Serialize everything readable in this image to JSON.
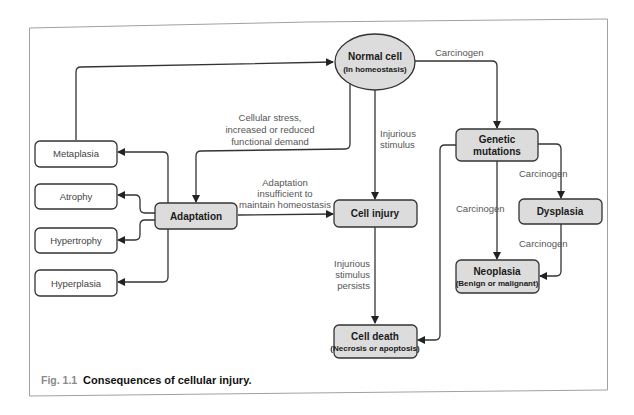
{
  "figure": {
    "number": "Fig. 1.1",
    "caption": "Consequences of cellular injury."
  },
  "nodes": {
    "normal_cell": {
      "title": "Normal cell",
      "subtitle": "(In homeostasis)"
    },
    "adaptation": {
      "title": "Adaptation"
    },
    "metaplasia": {
      "title": "Metaplasia"
    },
    "atrophy": {
      "title": "Atrophy"
    },
    "hypertrophy": {
      "title": "Hypertrophy"
    },
    "hyperplasia": {
      "title": "Hyperplasia"
    },
    "cell_injury": {
      "title": "Cell injury"
    },
    "cell_death": {
      "title": "Cell death",
      "subtitle": "(Necrosis or apoptosis)"
    },
    "genetic_mutations": {
      "title_line1": "Genetic",
      "title_line2": "mutations"
    },
    "dysplasia": {
      "title": "Dysplasia"
    },
    "neoplasia": {
      "title": "Neoplasia",
      "subtitle": "(Benign or malignant)"
    }
  },
  "edge_labels": {
    "stress_line1": "Cellular stress,",
    "stress_line2": "increased or reduced",
    "stress_line3": "functional demand",
    "injurious_line1": "Injurious",
    "injurious_line2": "stimulus",
    "insufficient_line1": "Adaptation",
    "insufficient_line2": "insufficient to",
    "insufficient_line3": "maintain homeostasis",
    "persists_line1": "Injurious",
    "persists_line2": "stimulus",
    "persists_line3": "persists",
    "carcinogen_normal_to_genetic": "Carcinogen",
    "carcinogen_genetic_to_dysplasia": "Carcinogen",
    "carcinogen_genetic_to_neoplasia": "Carcinogen",
    "carcinogen_dysplasia_to_neoplasia": "Carcinogen"
  },
  "colors": {
    "node_fill_grey": "#dcdcdc",
    "node_fill_white": "#ffffff",
    "stroke": "#333333",
    "frame": "#9a9a9a"
  }
}
